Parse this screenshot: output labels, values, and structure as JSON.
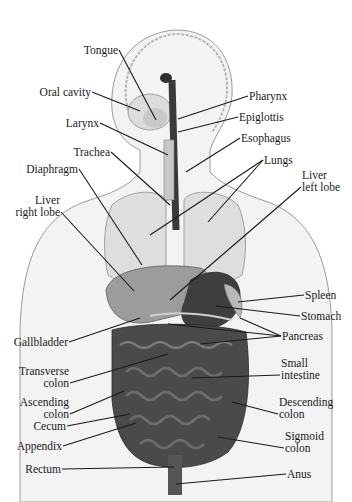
{
  "figure": {
    "labels_left": [
      {
        "id": "tongue",
        "lines": [
          "Tongue"
        ],
        "x": 118,
        "y": 51,
        "tx": 156,
        "ty": 120
      },
      {
        "id": "oral-cavity",
        "lines": [
          "Oral cavity"
        ],
        "x": 91,
        "y": 93,
        "tx": 140,
        "ty": 111
      },
      {
        "id": "larynx",
        "lines": [
          "Larynx"
        ],
        "x": 99,
        "y": 124,
        "tx": 168,
        "ty": 155
      },
      {
        "id": "trachea",
        "lines": [
          "Trachea"
        ],
        "x": 110,
        "y": 153,
        "tx": 170,
        "ty": 205
      },
      {
        "id": "diaphragm",
        "lines": [
          "Diaphragm"
        ],
        "x": 78,
        "y": 170,
        "tx": 142,
        "ty": 265
      },
      {
        "id": "liver-right-lobe",
        "lines": [
          "Liver",
          "right lobe"
        ],
        "x": 60,
        "y": 201,
        "tx": 134,
        "ty": 291
      },
      {
        "id": "gallbladder",
        "lines": [
          "Gallbladder"
        ],
        "x": 68,
        "y": 343,
        "tx": 140,
        "ty": 318
      },
      {
        "id": "transverse-colon",
        "lines": [
          "Transverse",
          "colon"
        ],
        "x": 69,
        "y": 372,
        "tx": 168,
        "ty": 354
      },
      {
        "id": "ascending-colon",
        "lines": [
          "Ascending",
          "colon"
        ],
        "x": 69,
        "y": 403,
        "tx": 124,
        "ty": 391
      },
      {
        "id": "cecum",
        "lines": [
          "Cecum"
        ],
        "x": 66,
        "y": 427,
        "tx": 130,
        "ty": 414
      },
      {
        "id": "appendix",
        "lines": [
          "Appendix"
        ],
        "x": 62,
        "y": 447,
        "tx": 136,
        "ty": 423
      },
      {
        "id": "rectum",
        "lines": [
          "Rectum"
        ],
        "x": 61,
        "y": 470,
        "tx": 174,
        "ty": 467
      }
    ],
    "labels_right": [
      {
        "id": "pharynx",
        "lines": [
          "Pharynx"
        ],
        "x": 249,
        "y": 97,
        "tx": 178,
        "ty": 119
      },
      {
        "id": "epiglottis",
        "lines": [
          "Epiglottis"
        ],
        "x": 239,
        "y": 118,
        "tx": 178,
        "ty": 132
      },
      {
        "id": "esophagus",
        "lines": [
          "Esophagus"
        ],
        "x": 241,
        "y": 139,
        "tx": 186,
        "ty": 172
      },
      {
        "id": "lungs",
        "lines": [
          "Lungs"
        ],
        "x": 264,
        "y": 161,
        "tx": 150,
        "ty": 235,
        "tx2": 208,
        "ty2": 222
      },
      {
        "id": "liver-left-lobe",
        "lines": [
          "Liver",
          "left lobe"
        ],
        "x": 302,
        "y": 176,
        "tx": 170,
        "ty": 300
      },
      {
        "id": "spleen",
        "lines": [
          "Spleen"
        ],
        "x": 305,
        "y": 296,
        "tx": 238,
        "ty": 302
      },
      {
        "id": "stomach",
        "lines": [
          "Stomach"
        ],
        "x": 301,
        "y": 317,
        "tx": 216,
        "ty": 306
      },
      {
        "id": "pancreas",
        "lines": [
          "Pancreas"
        ],
        "x": 282,
        "y": 337,
        "tx": 168,
        "ty": 324,
        "tx2": 240,
        "ty2": 318,
        "tx3": 200,
        "ty3": 344
      },
      {
        "id": "small-intestine",
        "lines": [
          "Small",
          "intestine"
        ],
        "x": 281,
        "y": 364,
        "tx": 192,
        "ty": 378
      },
      {
        "id": "descending-colon",
        "lines": [
          "Descending",
          "colon"
        ],
        "x": 279,
        "y": 403,
        "tx": 232,
        "ty": 402
      },
      {
        "id": "sigmoid-colon",
        "lines": [
          "Sigmoid",
          "colon"
        ],
        "x": 285,
        "y": 437,
        "tx": 218,
        "ty": 437
      },
      {
        "id": "anus",
        "lines": [
          "Anus"
        ],
        "x": 287,
        "y": 475,
        "tx": 176,
        "ty": 484
      }
    ],
    "colors": {
      "line": "#1a1a1a",
      "skin": "#ececec",
      "lung": "#d9d9d9",
      "organ_dark": "#3c3c3c",
      "intestine": "#555555",
      "liver": "#8f8f8f"
    }
  }
}
